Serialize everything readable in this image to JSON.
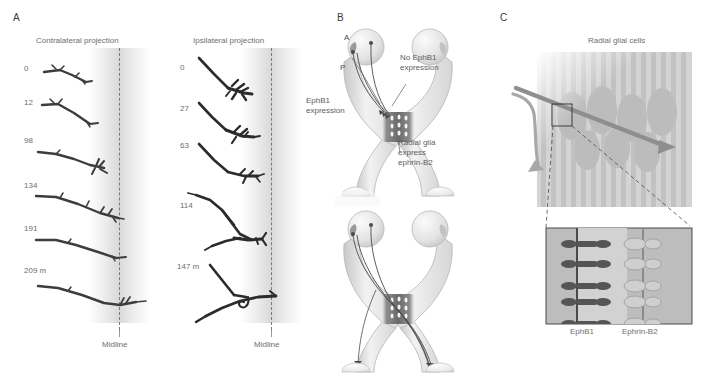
{
  "figure": {
    "panels": [
      {
        "letter": "A"
      },
      {
        "letter": "B"
      },
      {
        "letter": "C"
      }
    ]
  },
  "panelA": {
    "letter": "A",
    "columns": [
      {
        "title": "Contralateral projection",
        "midline_label": "Midline",
        "timepoints": [
          "0",
          "12",
          "98",
          "134",
          "191",
          "209 m"
        ]
      },
      {
        "title": "Ipsilateral projection",
        "midline_label": "Midline",
        "timepoints": [
          "0",
          "27",
          "63",
          "114",
          "147 m"
        ]
      }
    ]
  },
  "panelB": {
    "letter": "B",
    "labels": {
      "anterior": "A",
      "posterior": "P",
      "no_ephb1": "No  EphB1\nexpression",
      "no_ephb1_line1": "No  EphB1",
      "no_ephb1_line2": "expression",
      "ephb1_line1": "EphB1",
      "ephb1_line2": "expression",
      "radial_glia_line1": "Radial glia",
      "radial_glia_line2": "express",
      "radial_glia_line3": "ephrin-B2"
    }
  },
  "panelC": {
    "letter": "C",
    "title": "Radial glial cells",
    "inset_labels": {
      "left": "EphB1",
      "right": "Ephrin-B2"
    },
    "receptor_pair_count": 5
  },
  "colors": {
    "axon_dark": "#2f2f2f",
    "glia_gray": "#b8b8b8",
    "chiasm_dark": "#6e6e6e",
    "text_gray": "#6e6e6e",
    "panel_letter": "#3a3a3a",
    "inset_fill": "#bdbdbd",
    "ephrin_fill": "#cfcfcf",
    "receptor_dark": "#555555"
  }
}
